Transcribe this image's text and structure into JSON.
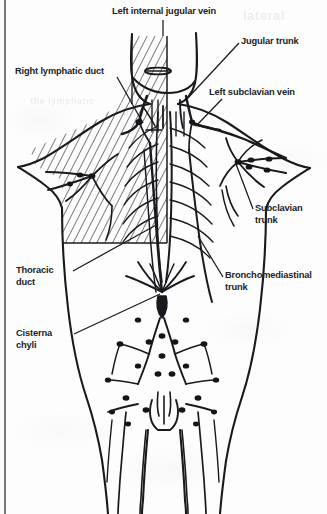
{
  "figure": {
    "background_color": "#fdfdfd",
    "ink_color": "#1a1a1e",
    "label_color": "#222226"
  },
  "border": {
    "name": "page-rule",
    "orientation": "vertical",
    "color": "#55555c"
  },
  "labels": [
    {
      "id": "left-internal-jugular-vein",
      "text": "Left internal jugular vein",
      "x": 112,
      "y": 6,
      "align": "left",
      "lines": 1
    },
    {
      "id": "jugular-trunk",
      "text": "Jugular trunk",
      "x": 241,
      "y": 36,
      "align": "left",
      "lines": 1
    },
    {
      "id": "right-lymphatic-duct",
      "text": "Right lymphatic duct",
      "x": 15,
      "y": 66,
      "align": "left",
      "lines": 1
    },
    {
      "id": "left-subclavian-vein",
      "text": "Left subclavian vein",
      "x": 209,
      "y": 87,
      "align": "left",
      "lines": 1
    },
    {
      "id": "subclavian-trunk",
      "text": "Subclavian trunk",
      "x": 255,
      "y": 203,
      "align": "left",
      "lines": 2
    },
    {
      "id": "thoracic-duct",
      "text": "Thoracic duct",
      "x": 16,
      "y": 265,
      "align": "left",
      "lines": 2
    },
    {
      "id": "bronchomediastinal-trunk",
      "text": "Bronchomediastinal trunk",
      "x": 225,
      "y": 270,
      "align": "left",
      "lines": 2
    },
    {
      "id": "cisterna-chyli",
      "text": "Cisterna chyli",
      "x": 16,
      "y": 328,
      "align": "left",
      "lines": 2
    }
  ],
  "bleed_through": [
    {
      "id": "bleed-top-right",
      "text": "lateral",
      "x": 243,
      "y": 8,
      "size": 13
    },
    {
      "id": "bleed-mid-left",
      "text": "the lymphatic",
      "x": 30,
      "y": 96,
      "size": 9
    },
    {
      "id": "bleed-mid-center",
      "text": "drainage region",
      "x": 120,
      "y": 108,
      "size": 9
    }
  ],
  "diagram_regions": {
    "hatched_area": {
      "name": "right-lymphatic-drainage-territory",
      "description": "Diagonally hatched region indicating area drained by the right lymphatic duct",
      "side": "viewer-left"
    },
    "lymph_nodes": {
      "name": "lymph-node-cluster",
      "description": "Solid dots marking regional lymph nodes along the vessels"
    }
  }
}
